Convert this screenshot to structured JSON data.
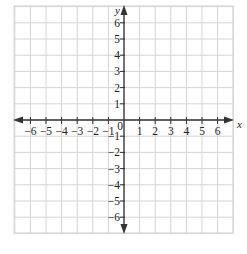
{
  "chart_data": {
    "type": "scatter",
    "title": "",
    "xlabel": "x",
    "ylabel": "y",
    "xlim": [
      -7,
      7
    ],
    "ylim": [
      -7,
      7
    ],
    "grid": true,
    "x_ticks": [
      -6,
      -5,
      -4,
      -3,
      -2,
      -1,
      0,
      1,
      2,
      3,
      4,
      5,
      6
    ],
    "y_ticks": [
      -6,
      -5,
      -4,
      -3,
      -2,
      -1,
      1,
      2,
      3,
      4,
      5,
      6
    ],
    "x_tick_labels": [
      "−6",
      "−5",
      "−4",
      "−3",
      "−2",
      "−1",
      "0",
      "1",
      "2",
      "3",
      "4",
      "5",
      "6"
    ],
    "y_tick_labels": [
      "−6",
      "−5",
      "−4",
      "−3",
      "−2",
      "−1",
      "1",
      "2",
      "3",
      "4",
      "5",
      "6"
    ],
    "series": [],
    "legend": null
  },
  "axes": {
    "x_label": "x",
    "y_label": "y",
    "origin_label": "0"
  },
  "colors": {
    "grid": "#d4d4d4",
    "axis": "#333333",
    "text": "#222222"
  }
}
